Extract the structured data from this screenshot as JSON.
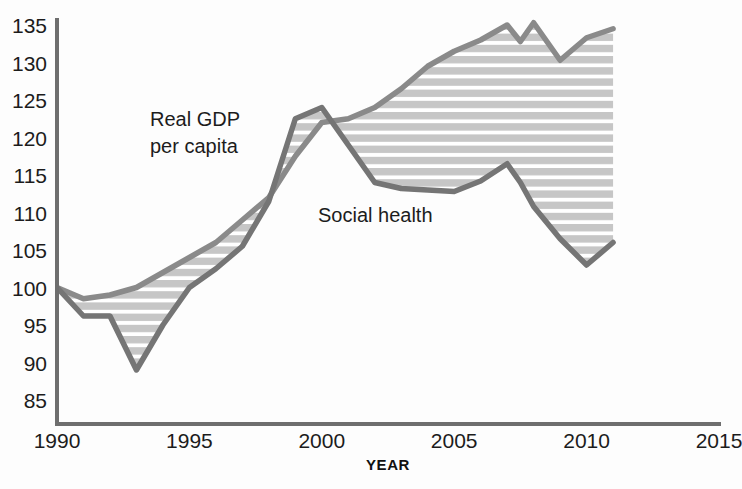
{
  "chart_data": {
    "type": "line",
    "title": "",
    "xlabel": "YEAR",
    "ylabel": "",
    "xlim": [
      1990,
      2015
    ],
    "ylim": [
      83,
      135
    ],
    "grid": false,
    "legend_position": "inline-annotations",
    "xticks": [
      "1990",
      "1995",
      "2000",
      "2005",
      "2010",
      "2015"
    ],
    "xtick_values": [
      1990,
      1995,
      2000,
      2005,
      2010,
      2015
    ],
    "yticks": [
      "85",
      "90",
      "95",
      "100",
      "105",
      "110",
      "115",
      "120",
      "125",
      "130",
      "135"
    ],
    "ytick_values": [
      85,
      90,
      95,
      100,
      105,
      110,
      115,
      120,
      125,
      130,
      135
    ],
    "x": [
      1990,
      1991,
      1992,
      1993,
      1994,
      1995,
      1996,
      1997,
      1998,
      1999,
      2000,
      2001,
      2002,
      2003,
      2004,
      2005,
      2006,
      2007,
      2007.5,
      2008,
      2009,
      2010,
      2011
    ],
    "series": [
      {
        "name": "Real GDP per capita",
        "color": "#8a8a8a",
        "values": [
          100.0,
          98.5,
          99.0,
          100.0,
          102.0,
          104.0,
          106.0,
          109.0,
          112.0,
          117.5,
          122.0,
          122.5,
          124.0,
          126.5,
          129.5,
          131.5,
          133.0,
          135.0,
          132.8,
          135.3,
          130.3,
          133.3,
          134.5
        ]
      },
      {
        "name": "Social health",
        "color": "#757575",
        "values": [
          100.0,
          96.2,
          96.2,
          89.0,
          95.0,
          100.0,
          102.5,
          105.5,
          111.5,
          122.5,
          124.0,
          119.0,
          114.0,
          113.2,
          113.0,
          112.8,
          114.2,
          116.5,
          114.0,
          110.8,
          106.5,
          103.0,
          106.0
        ]
      }
    ],
    "band_fill": {
      "description": "horizontal-striped shading between the two series",
      "stripe_color": "#c6c6c6",
      "gap_color": "#ffffff"
    },
    "annotations": [
      {
        "text_line1": "Real GDP",
        "text_line2": "per capita",
        "x": 1995.2,
        "y": 119.5
      },
      {
        "text_line1": "Social health",
        "text_line2": "",
        "x": 2003.0,
        "y": 109.0
      }
    ]
  },
  "axis": {
    "line_color": "#6e6e6e",
    "xlabel": "YEAR"
  }
}
